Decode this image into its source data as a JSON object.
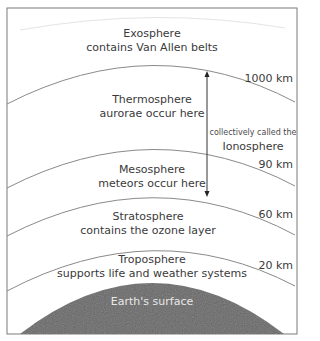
{
  "layers": [
    {
      "name": "Exosphere",
      "description": "contains Van Allen belts",
      "altitude": ""
    },
    {
      "name": "Thermosphere",
      "description": "aurorae occur here",
      "altitude": "1000 km"
    },
    {
      "name": "Mesosphere",
      "description": "meteors occur here",
      "altitude": "90 km"
    },
    {
      "name": "Stratosphere",
      "description": "contains the ozone layer",
      "altitude": "60 km"
    },
    {
      "name": "Troposphere",
      "description": "supports life and weather systems",
      "altitude": "20 km"
    }
  ],
  "ionosphere": {
    "caption": "collectively  called the",
    "name": "Ionosphere"
  },
  "earth": {
    "label": "Earth's surface",
    "color": "#666666"
  },
  "colors": {
    "line": "#8a8a8a",
    "border": "#7a7a7a",
    "text": "#3a3a3a"
  }
}
